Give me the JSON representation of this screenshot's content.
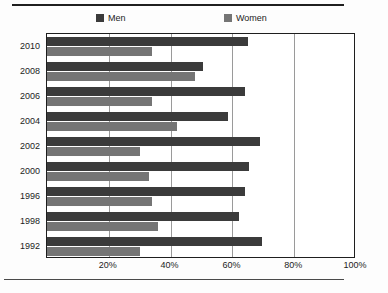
{
  "figure": {
    "title": "",
    "title_truncated": true
  },
  "legend": {
    "position": "top",
    "entries": [
      {
        "label": "Men",
        "color": "#3b3b3b"
      },
      {
        "label": "Women",
        "color": "#757575"
      }
    ]
  },
  "axis": {
    "x_ticks": [
      "20%",
      "40%",
      "60%",
      "80%",
      "100%"
    ],
    "y_ticks": [
      "2010",
      "2008",
      "2006",
      "2004",
      "2002",
      "2000",
      "1996",
      "1998",
      "1992"
    ]
  },
  "chart_data": {
    "type": "bar",
    "orientation": "horizontal",
    "title": "",
    "xlabel": "",
    "ylabel": "",
    "xlim": [
      0,
      100
    ],
    "grid": true,
    "legend_position": "top",
    "categories": [
      "2010",
      "2008",
      "2006",
      "2004",
      "2002",
      "2000",
      "1996",
      "1998",
      "1992"
    ],
    "series": [
      {
        "name": "Men",
        "color": "#3b3b3b",
        "values": [
          65,
          50.5,
          64,
          58.5,
          69,
          65.5,
          64,
          62,
          69.5
        ]
      },
      {
        "name": "Women",
        "color": "#757575",
        "values": [
          34,
          48,
          34,
          42,
          30,
          33,
          34,
          36,
          30
        ]
      }
    ],
    "value_unit": "%",
    "tick_labels_x": [
      "20%",
      "40%",
      "60%",
      "80%",
      "100%"
    ],
    "tick_values_x": [
      20,
      40,
      60,
      80,
      100
    ]
  }
}
